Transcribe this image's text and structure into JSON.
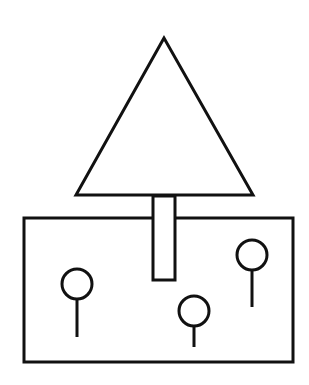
{
  "diagram": {
    "width": 309,
    "height": 385,
    "background": "#ffffff",
    "stroke_color": "#111111",
    "stroke_width": 3,
    "triangle": {
      "points": [
        [
          164,
          38
        ],
        [
          76,
          195
        ],
        [
          253,
          195
        ]
      ]
    },
    "trunk": {
      "x": 153,
      "y": 196,
      "width": 22,
      "height": 84
    },
    "box": {
      "x": 24,
      "y": 218,
      "width": 269,
      "height": 144
    },
    "pins": [
      {
        "cx": 77,
        "cy": 284,
        "r": 15,
        "stem_end": 337
      },
      {
        "cx": 194,
        "cy": 311,
        "r": 15,
        "stem_end": 347
      },
      {
        "cx": 252,
        "cy": 255,
        "r": 15,
        "stem_end": 307
      }
    ]
  }
}
